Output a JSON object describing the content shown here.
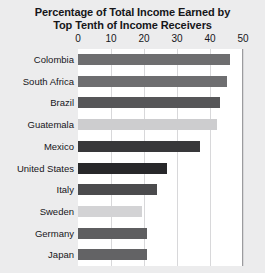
{
  "chart_data": {
    "type": "bar",
    "orientation": "horizontal",
    "title": "Percentage of Total Income Earned by Top Tenth of Income Receivers",
    "title_lines": [
      "Percentage of Total Income Earned by",
      "Top Tenth of Income Receivers"
    ],
    "xlabel": "",
    "ylabel": "",
    "xlim": [
      0,
      50
    ],
    "xticks": [
      0,
      10,
      20,
      30,
      40,
      50
    ],
    "xtick_labels": [
      "0",
      "10",
      "20",
      "30",
      "40",
      "50"
    ],
    "grid": true,
    "grid_axis": "x",
    "legend": false,
    "categories": [
      "Colombia",
      "South Africa",
      "Brazil",
      "Guatemala",
      "Mexico",
      "United States",
      "Italy",
      "Sweden",
      "Germany",
      "Japan"
    ],
    "values": [
      46,
      45,
      43,
      42,
      37,
      27,
      24,
      19.5,
      21,
      21
    ],
    "bar_colors": [
      "#6e6e70",
      "#6e6e70",
      "#565658",
      "#cdcdcf",
      "#38383a",
      "#28282a",
      "#4b4b4d",
      "#d3d3d5",
      "#5e5e60",
      "#636365"
    ],
    "bars": [
      {
        "category": "Colombia",
        "value": 46,
        "color": "#6e6e70"
      },
      {
        "category": "South Africa",
        "value": 45,
        "color": "#6e6e70"
      },
      {
        "category": "Brazil",
        "value": 43,
        "color": "#565658"
      },
      {
        "category": "Guatemala",
        "value": 42,
        "color": "#cdcdcf"
      },
      {
        "category": "Mexico",
        "value": 37,
        "color": "#38383a"
      },
      {
        "category": "United States",
        "value": 27,
        "color": "#28282a"
      },
      {
        "category": "Italy",
        "value": 24,
        "color": "#4b4b4d"
      },
      {
        "category": "Sweden",
        "value": 19.5,
        "color": "#d3d3d5"
      },
      {
        "category": "Germany",
        "value": 21,
        "color": "#5e5e60"
      },
      {
        "category": "Japan",
        "value": 21,
        "color": "#636365"
      }
    ]
  },
  "colors": {
    "background": "#ececed",
    "plot_background": "#ffffff",
    "gridline": "#d8d8da",
    "text": "#16161a",
    "plot_border": "#9b9b9e"
  }
}
